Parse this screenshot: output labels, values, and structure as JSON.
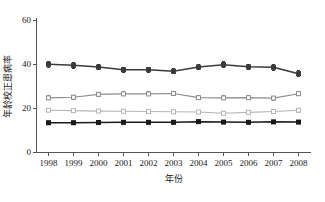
{
  "chart_data": {
    "type": "line",
    "title": "",
    "xlabel": "年份",
    "ylabel": "年龄校正患病率",
    "x": [
      1998,
      1999,
      2000,
      2001,
      2002,
      2003,
      2004,
      2005,
      2006,
      2007,
      2008
    ],
    "xtick_labels": [
      "1998",
      "1999",
      "2000",
      "2001",
      "2002",
      "2003",
      "2004",
      "2005",
      "2006",
      "2007",
      "2008"
    ],
    "ytick_labels": [
      "0",
      "20",
      "40",
      "60"
    ],
    "yticks": [
      0,
      20,
      40,
      60
    ],
    "ylim": [
      0,
      60
    ],
    "xlim": [
      1997.5,
      2008.5
    ],
    "grid": false,
    "legend": "none",
    "errorbars": true,
    "series": [
      {
        "name": "series-1",
        "marker": "filled-square",
        "color": "#3a3a3a",
        "values": [
          39.9,
          39.4,
          38.6,
          37.4,
          37.4,
          36.7,
          38.6,
          39.7,
          38.7,
          38.5,
          35.6
        ],
        "err": [
          1.3,
          1.2,
          1.1,
          1.1,
          1.1,
          1.1,
          1.2,
          1.3,
          1.2,
          1.3,
          1.4
        ]
      },
      {
        "name": "series-2",
        "marker": "open-square",
        "color": "#8c8c8c",
        "values": [
          24.6,
          24.9,
          26.2,
          26.4,
          26.4,
          26.6,
          24.7,
          24.6,
          24.7,
          24.5,
          26.5
        ],
        "err": [
          0.9,
          0.9,
          0.9,
          0.9,
          0.9,
          0.9,
          0.9,
          0.9,
          0.9,
          0.9,
          1.0
        ]
      },
      {
        "name": "series-3",
        "marker": "open-square",
        "color": "#b5b5b5",
        "values": [
          19.0,
          18.8,
          18.6,
          18.5,
          18.4,
          18.3,
          18.2,
          17.6,
          18.0,
          18.4,
          19.0
        ],
        "err": [
          0.7,
          0.7,
          0.7,
          0.7,
          0.7,
          0.7,
          0.7,
          0.7,
          0.7,
          0.7,
          0.8
        ]
      },
      {
        "name": "series-4",
        "marker": "filled-square",
        "color": "#1a1a1a",
        "values": [
          13.3,
          13.3,
          13.4,
          13.5,
          13.5,
          13.5,
          13.8,
          13.6,
          13.5,
          13.7,
          13.6
        ],
        "err": [
          0.6,
          0.6,
          0.6,
          0.6,
          0.6,
          0.6,
          0.6,
          0.6,
          0.6,
          0.6,
          0.7
        ]
      }
    ]
  }
}
